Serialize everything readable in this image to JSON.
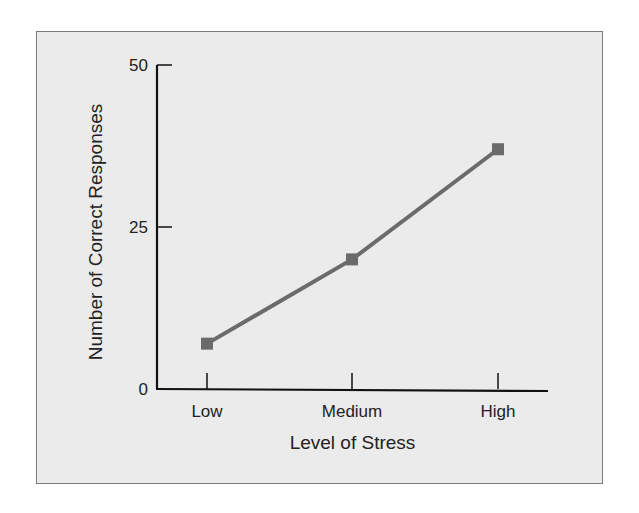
{
  "chart_data": {
    "type": "line",
    "title": "",
    "xlabel": "Level of Stress",
    "ylabel": "Number of Correct Responses",
    "categories": [
      "Low",
      "Medium",
      "High"
    ],
    "series": [
      {
        "name": "Correct Responses",
        "values": [
          7,
          20,
          37
        ],
        "color": "#6b6b6b",
        "marker": "square"
      }
    ],
    "ylim": [
      0,
      50
    ],
    "yticks": [
      0,
      25,
      50
    ],
    "grid": false,
    "legend": null
  },
  "colors": {
    "background": "#ebebeb",
    "frame_border": "#7a7a7a",
    "axis": "#111111",
    "series": "#6b6b6b"
  }
}
